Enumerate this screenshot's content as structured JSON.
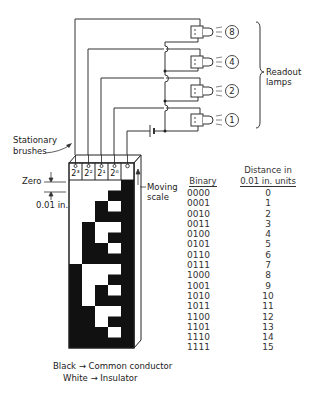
{
  "header": {
    "page_fragment": "277"
  },
  "readout": {
    "label_line1": "Readout",
    "label_line2": "lamps",
    "lamps": [
      {
        "value": "8",
        "y": 32
      },
      {
        "value": "4",
        "y": 62
      },
      {
        "value": "2",
        "y": 91
      },
      {
        "value": "1",
        "y": 120
      }
    ]
  },
  "labels": {
    "stationary_line1": "Stationary",
    "stationary_line2": "brushes",
    "zero": "Zero",
    "increment": "0.01 in.",
    "moving_line1": "Moving",
    "moving_line2": "scale",
    "legend_black": "Black → Common conductor",
    "legend_white": "White → Insulator"
  },
  "scale": {
    "columns": [
      "2³",
      "2²",
      "2¹",
      "2⁰",
      ""
    ],
    "note": "rows 0..15 top to bottom; 1 = black conductor"
  },
  "table": {
    "col1_header": "Binary",
    "col2_header_line1": "Distance in",
    "col2_header_line2": "0.01 in. units",
    "rows": [
      {
        "binary": "0000",
        "distance": "0"
      },
      {
        "binary": "0001",
        "distance": "1"
      },
      {
        "binary": "0010",
        "distance": "2"
      },
      {
        "binary": "0011",
        "distance": "3"
      },
      {
        "binary": "0100",
        "distance": "4"
      },
      {
        "binary": "0101",
        "distance": "5"
      },
      {
        "binary": "0110",
        "distance": "6"
      },
      {
        "binary": "0111",
        "distance": "7"
      },
      {
        "binary": "1000",
        "distance": "8"
      },
      {
        "binary": "1001",
        "distance": "9"
      },
      {
        "binary": "1010",
        "distance": "10"
      },
      {
        "binary": "1011",
        "distance": "11"
      },
      {
        "binary": "1100",
        "distance": "12"
      },
      {
        "binary": "1101",
        "distance": "13"
      },
      {
        "binary": "1110",
        "distance": "14"
      },
      {
        "binary": "1111",
        "distance": "15"
      }
    ]
  }
}
